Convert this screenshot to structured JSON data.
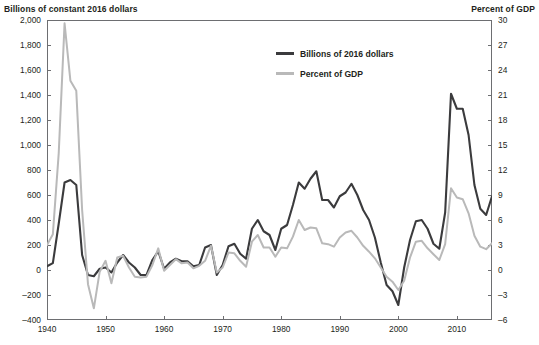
{
  "chart_data": {
    "type": "line",
    "title": "",
    "left_axis": {
      "label": "Billions of constant 2016 dollars",
      "ylim": [
        -400,
        2000
      ],
      "ticks": [
        2000,
        1800,
        1600,
        1400,
        1200,
        1000,
        800,
        600,
        400,
        200,
        0,
        -200,
        -400
      ],
      "tick_labels": [
        "2,000",
        "1,800",
        "1,600",
        "1,400",
        "1,200",
        "1,000",
        "800",
        "600",
        "400",
        "200",
        "0",
        "–200",
        "–400"
      ]
    },
    "right_axis": {
      "label": "Percent of GDP",
      "ylim": [
        -6,
        30
      ],
      "ticks": [
        30,
        27,
        24,
        21,
        18,
        15,
        12,
        9,
        6,
        3,
        0,
        -3,
        -6
      ],
      "tick_labels": [
        "30",
        "27",
        "24",
        "21",
        "18",
        "15",
        "12",
        "9",
        "6",
        "3",
        "0",
        "–3",
        "–6"
      ]
    },
    "xlabel": "",
    "xlim": [
      1940,
      2016
    ],
    "xticks": [
      1940,
      1950,
      1960,
      1970,
      1980,
      1990,
      2000,
      2010
    ],
    "xtick_labels": [
      "1940",
      "1950",
      "1960",
      "1970",
      "1980",
      "1990",
      "2000",
      "2010"
    ],
    "grid": false,
    "legend_position": "top-center",
    "colors": {
      "series_dark": "#3b3b3d",
      "series_light": "#b9b9b9",
      "axis": "#6d6e71",
      "text": "#231f20"
    },
    "x": [
      1940,
      1941,
      1942,
      1943,
      1944,
      1945,
      1946,
      1947,
      1948,
      1949,
      1950,
      1951,
      1952,
      1953,
      1954,
      1955,
      1956,
      1957,
      1958,
      1959,
      1960,
      1961,
      1962,
      1963,
      1964,
      1965,
      1966,
      1967,
      1968,
      1969,
      1970,
      1971,
      1972,
      1973,
      1974,
      1975,
      1976,
      1977,
      1978,
      1979,
      1980,
      1981,
      1982,
      1983,
      1984,
      1985,
      1986,
      1987,
      1988,
      1989,
      1990,
      1991,
      1992,
      1993,
      1994,
      1995,
      1996,
      1997,
      1998,
      1999,
      2000,
      2001,
      2002,
      2003,
      2004,
      2005,
      2006,
      2007,
      2008,
      2009,
      2010,
      2011,
      2012,
      2013,
      2014,
      2015,
      2016
    ],
    "series": [
      {
        "name": "Billions of 2016 dollars",
        "axis": "left",
        "color": "#3b3b3d",
        "width": 2.1,
        "values": [
          -30,
          -55,
          -370,
          -700,
          -720,
          -680,
          -120,
          40,
          50,
          -10,
          -20,
          20,
          -60,
          -120,
          -60,
          -20,
          40,
          40,
          -80,
          -150,
          -10,
          -60,
          -90,
          -70,
          -70,
          -30,
          -40,
          -180,
          -200,
          40,
          -40,
          -190,
          -210,
          -130,
          -90,
          -330,
          -400,
          -310,
          -280,
          -160,
          -330,
          -360,
          -520,
          -700,
          -650,
          -730,
          -790,
          -560,
          -560,
          -500,
          -590,
          -620,
          -690,
          -600,
          -480,
          -400,
          -260,
          -60,
          120,
          170,
          280,
          -20,
          -240,
          -390,
          -400,
          -330,
          -210,
          -170,
          -460,
          -1410,
          -1290,
          -1290,
          -1080,
          -680,
          -490,
          -440,
          -590
        ]
      },
      {
        "name": "Percent of GDP",
        "axis": "right",
        "color": "#b9b9b9",
        "width": 2.0,
        "values": [
          -3.0,
          -4.3,
          -14.0,
          -29.6,
          -22.7,
          -21.5,
          -7.2,
          1.7,
          4.6,
          0.2,
          -1.1,
          1.6,
          -1.5,
          -1.7,
          -0.3,
          0.8,
          0.9,
          0.8,
          -0.6,
          -2.6,
          0.1,
          -0.6,
          -1.3,
          -0.8,
          -0.9,
          -0.2,
          -0.5,
          -1.1,
          -2.9,
          0.3,
          -0.3,
          -2.1,
          -2.0,
          -1.1,
          -0.4,
          -3.4,
          -4.2,
          -2.7,
          -2.7,
          -1.6,
          -2.7,
          -2.6,
          -4.0,
          -6.0,
          -4.8,
          -5.1,
          -5.0,
          -3.2,
          -3.1,
          -2.8,
          -3.9,
          -4.5,
          -4.7,
          -3.9,
          -2.9,
          -2.2,
          -1.4,
          -0.3,
          0.8,
          1.4,
          2.4,
          1.3,
          -1.5,
          -3.4,
          -3.5,
          -2.6,
          -1.9,
          -1.2,
          -3.1,
          -9.8,
          -8.7,
          -8.5,
          -6.8,
          -4.1,
          -2.8,
          -2.5,
          -3.2
        ]
      }
    ],
    "legend": [
      {
        "label": "Billions of 2016 dollars",
        "color": "#3b3b3d",
        "style": "thick"
      },
      {
        "label": "Percent of GDP",
        "color": "#b9b9b9",
        "style": "normal"
      }
    ]
  }
}
